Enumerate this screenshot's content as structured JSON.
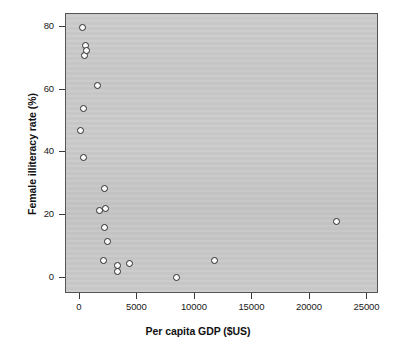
{
  "chart_data": {
    "type": "scatter",
    "title": "",
    "xlabel": "Per capita GDP ($US)",
    "ylabel": "Female illiteracy rate (%)",
    "xlim": [
      -1200,
      26000
    ],
    "ylim": [
      -5,
      84
    ],
    "xticks": [
      0,
      5000,
      10000,
      15000,
      20000,
      25000
    ],
    "xticklabels": [
      "0",
      "5000",
      "10000",
      "15000",
      "20000",
      "25000"
    ],
    "yticks": [
      0,
      20,
      40,
      60,
      80
    ],
    "yticklabels": [
      "0",
      "20",
      "40",
      "60",
      "80"
    ],
    "grid": false,
    "legend": null,
    "panel_background": "#c9c9c9",
    "marker": {
      "shape": "circle",
      "facecolor": "#fbfbfb",
      "edgecolor": "#2b2b2b",
      "size": 7
    },
    "points": [
      {
        "x": 86,
        "y": 47.1
      },
      {
        "x": 259,
        "y": 79.8
      },
      {
        "x": 345,
        "y": 54.0
      },
      {
        "x": 345,
        "y": 38.3
      },
      {
        "x": 431,
        "y": 70.7
      },
      {
        "x": 517,
        "y": 74.1
      },
      {
        "x": 603,
        "y": 72.3
      },
      {
        "x": 1552,
        "y": 61.3
      },
      {
        "x": 1724,
        "y": 21.7
      },
      {
        "x": 2069,
        "y": 5.7
      },
      {
        "x": 2155,
        "y": 28.6
      },
      {
        "x": 2155,
        "y": 16.0
      },
      {
        "x": 2241,
        "y": 22.3
      },
      {
        "x": 2414,
        "y": 11.6
      },
      {
        "x": 3276,
        "y": 4.1
      },
      {
        "x": 3276,
        "y": 2.2
      },
      {
        "x": 4310,
        "y": 4.7
      },
      {
        "x": 8362,
        "y": 0.3
      },
      {
        "x": 11724,
        "y": 5.7
      },
      {
        "x": 22328,
        "y": 17.9
      }
    ]
  }
}
